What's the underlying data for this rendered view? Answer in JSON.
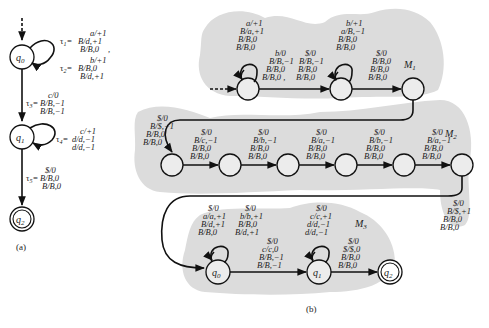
{
  "figure": {
    "part_a": {
      "caption": "(a)",
      "states": [
        "q0",
        "q1",
        "q2"
      ],
      "state_labels": {
        "q0": "q",
        "q0_sub": "0",
        "q1": "q",
        "q1_sub": "1",
        "q2": "q",
        "q2_sub": "2"
      },
      "transitions": {
        "t1": {
          "name": "τ1",
          "lines": [
            "a/+1",
            "B/d,+1",
            "B/B,0"
          ],
          "trailing": ","
        },
        "t2": {
          "name": "τ2",
          "lines": [
            "b/+1",
            "B/B,0",
            "B/d,+1"
          ]
        },
        "t3": {
          "name": "τ3",
          "lines": [
            "c/0",
            "B/B,−1",
            "B/B,−1"
          ]
        },
        "t4": {
          "name": "τ4",
          "lines": [
            "c/+1",
            "d/d,−1",
            "d/d,−1"
          ]
        },
        "t5": {
          "name": "τ5",
          "lines": [
            "$/0",
            "B/B,0",
            "B/B,0"
          ]
        }
      }
    },
    "part_b": {
      "caption": "(b)",
      "modules": {
        "m1": "M",
        "m1_sub": "1",
        "m2": "M",
        "m2_sub": "2",
        "m3": "M",
        "m3_sub": "3"
      },
      "m1": {
        "loop1": [
          "a/+1",
          "B/a,+1",
          "B/B,0",
          "B/B,0"
        ],
        "edge1a": [
          "b/0",
          "B/B,−1",
          "B/B,0",
          "B/B,0 ,"
        ],
        "edge1b": [
          "$/0",
          "B/B,−1",
          "B/B,0",
          "B/B,0"
        ],
        "loop2": [
          "b/+1",
          "a/B,−1",
          "B/B,0",
          "B/B,0"
        ],
        "edge2": [
          "$/0",
          "B/B,0",
          "B/B,0",
          "B/B,0"
        ]
      },
      "m2": {
        "entry": [
          "$/0",
          "B/$,−1",
          "B/B,0",
          "B/B,0"
        ],
        "e1": [
          "$/0",
          "B/c,−1",
          "B/B,0",
          "B/B,0"
        ],
        "e2": [
          "$/0",
          "B/b,−1",
          "B/B,0",
          "B/B,0"
        ],
        "e3": [
          "$/0",
          "B/a,−1",
          "B/B,0",
          "B/B,0"
        ],
        "e4": [
          "$/0",
          "B/b,−1",
          "B/B,0",
          "B/B,0"
        ],
        "e5": [
          "$/0",
          "B/a,−1",
          "B/B,0",
          "B/B,0"
        ],
        "exit": [
          "$/0",
          "B/$,+1",
          "B/B,0",
          "B/B,0"
        ]
      },
      "m3": {
        "q0_loop": [
          "$/0",
          "a/a,+1",
          "B/d,+1",
          "B/B,0"
        ],
        "q0_loop2": [
          "$/0",
          "b/b,+1",
          "B/B,0",
          "B/d,+1"
        ],
        "q0_q1": [
          "$/0",
          "c/c,0",
          "B/B,−1",
          "B/B,−1"
        ],
        "q1_loop": [
          "$/0",
          "c/c,+1",
          "d/d,−1",
          "d/d,−1"
        ],
        "q1_q2": [
          "$/0",
          "$/$,0",
          "B/B,0",
          "B/B,0"
        ]
      }
    }
  }
}
